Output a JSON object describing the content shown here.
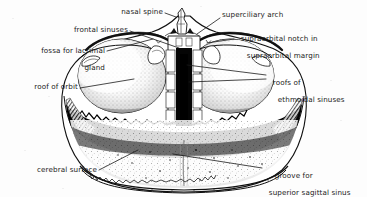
{
  "figure": {
    "style": "black and white engraved line drawing with stipple shading",
    "background_color": "#fdfdfd",
    "ink_color": "#1a1a1a"
  },
  "labels": [
    {
      "id": "nasal-spine",
      "text": "nasal spine",
      "lines": [
        "nasal spine"
      ],
      "align": "right",
      "x": 163,
      "y": 11,
      "leader": [
        [
          165,
          14
        ],
        [
          176,
          17
        ]
      ]
    },
    {
      "id": "frontal-sinuses",
      "text": "frontal sinuses",
      "lines": [
        "frontal sinuses"
      ],
      "align": "right",
      "x": 128,
      "y": 29,
      "leader": [
        [
          130,
          32
        ],
        [
          178,
          47
        ]
      ]
    },
    {
      "id": "fossa-for-lacrimal-gland",
      "text": "fossa for lacrimal gland",
      "lines": [
        "fossa for lacrimal",
        "gland"
      ],
      "align": "right",
      "x": 105,
      "y": 41,
      "leader": [
        [
          107,
          52
        ],
        [
          152,
          40
        ]
      ]
    },
    {
      "id": "roof-of-orbit",
      "text": "roof of orbit",
      "lines": [
        "roof of orbit"
      ],
      "align": "right",
      "x": 78,
      "y": 86,
      "leader": [
        [
          80,
          89
        ],
        [
          133,
          80
        ]
      ]
    },
    {
      "id": "cerebral-surface",
      "text": "cerebral surface",
      "lines": [
        "cerebral surface"
      ],
      "align": "right",
      "x": 97,
      "y": 170,
      "leader": [
        [
          99,
          171
        ],
        [
          137,
          151
        ]
      ]
    },
    {
      "id": "superciliary-arch",
      "text": "superciliary arch",
      "lines": [
        "superciliary arch"
      ],
      "align": "left",
      "x": 222,
      "y": 14,
      "leader": [
        [
          220,
          19
        ],
        [
          196,
          34
        ]
      ]
    },
    {
      "id": "supraorbital-notch",
      "text": "supraorbital notch in supraorbital margin",
      "lines": [
        "supraorbital notch in",
        "supraorbital margin"
      ],
      "align": "left",
      "x": 236,
      "y": 30,
      "leader": [
        [
          234,
          40
        ],
        [
          206,
          43
        ]
      ]
    },
    {
      "id": "roofs-of-ethmoidal-sinuses",
      "text": "roofs of ethmoidal sinuses",
      "lines": [
        "roofs of",
        "ethmoidal sinuses"
      ],
      "align": "left",
      "x": 268,
      "y": 73,
      "leader": [
        [
          266,
          76
        ],
        [
          186,
          66
        ]
      ],
      "leader2": [
        [
          266,
          80
        ],
        [
          188,
          82
        ]
      ]
    },
    {
      "id": "groove-for-superior-sagittal-sinus",
      "text": "groove for superior sagittal sinus",
      "lines": [
        "groove for",
        "superior sagittal sinus"
      ],
      "align": "left",
      "x": 264,
      "y": 166,
      "leader": [
        [
          262,
          169
        ],
        [
          172,
          155
        ]
      ]
    }
  ]
}
